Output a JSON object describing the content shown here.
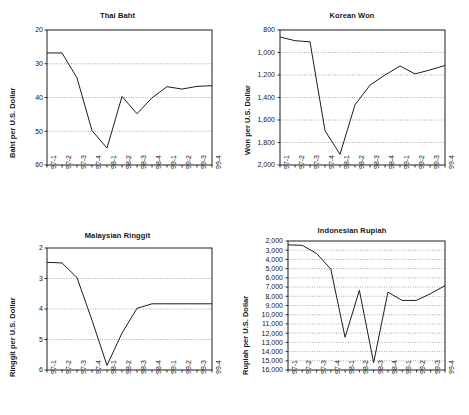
{
  "figure": {
    "width": 469,
    "height": 415,
    "background": "#ffffff",
    "line_color": "#1d1d1d",
    "grid_color": "#6e6e6e",
    "text_color": "#161616"
  },
  "categories": [
    "97-1",
    "97-2",
    "97-3",
    "97-4",
    "98-1",
    "98-2",
    "98-3",
    "98-4",
    "99-1",
    "99-2",
    "99-3",
    "99-4"
  ],
  "chart_data": [
    {
      "type": "line",
      "id": "thai-baht",
      "title": "Thai Baht",
      "xlabel": "",
      "ylabel": "Baht per U.S. Dollar",
      "x": [
        "97-1",
        "97-2",
        "97-3",
        "97-4",
        "98-1",
        "98-2",
        "98-3",
        "98-4",
        "99-1",
        "99-2",
        "99-3",
        "99-4"
      ],
      "values": [
        26.8,
        26.8,
        34.2,
        49.8,
        55.0,
        39.7,
        44.8,
        40.1,
        36.8,
        37.5,
        36.7,
        36.5
      ],
      "yticks": [
        "20",
        "30",
        "40",
        "50",
        "60"
      ],
      "ytickvalues": [
        20,
        30,
        40,
        50,
        60
      ],
      "ylim": [
        20,
        60
      ],
      "y_inverted": true,
      "grid": true,
      "legend": "none"
    },
    {
      "type": "line",
      "id": "korean-won",
      "title": "Korean Won",
      "xlabel": "",
      "ylabel": "Won per U.S. Dollar",
      "x": [
        "97-1",
        "97-2",
        "97-3",
        "97-4",
        "98-1",
        "98-2",
        "98-3",
        "98-4",
        "99-1",
        "99-2",
        "99-3",
        "99-4"
      ],
      "values": [
        862,
        895,
        905,
        1695,
        1905,
        1465,
        1290,
        1200,
        1120,
        1190,
        1155,
        1115
      ],
      "yticks": [
        "800",
        "1,000",
        "1,200",
        "1,400",
        "1,600",
        "1,800",
        "2,000"
      ],
      "ytickvalues": [
        800,
        1000,
        1200,
        1400,
        1600,
        1800,
        2000
      ],
      "ylim": [
        800,
        2000
      ],
      "y_inverted": true,
      "grid": true,
      "legend": "none"
    },
    {
      "type": "line",
      "id": "malaysian-ringgit",
      "title": "Malaysian Ringgit",
      "xlabel": "",
      "ylabel": "Ringgit per U.S. Dollar",
      "x": [
        "97-1",
        "97-2",
        "97-3",
        "97-4",
        "98-1",
        "98-2",
        "98-3",
        "98-4",
        "99-1",
        "99-2",
        "99-3",
        "99-4"
      ],
      "values": [
        2.47,
        2.49,
        2.97,
        4.37,
        5.85,
        4.79,
        3.98,
        3.83,
        3.83,
        3.83,
        3.83,
        3.83
      ],
      "yticks": [
        "2",
        "3",
        "4",
        "5",
        "6"
      ],
      "ytickvalues": [
        2,
        3,
        4,
        5,
        6
      ],
      "ylim": [
        2,
        6
      ],
      "y_inverted": true,
      "grid": true,
      "legend": "none"
    },
    {
      "type": "line",
      "id": "indonesian-rupiah",
      "title": "Indonesian Rupiah",
      "xlabel": "",
      "ylabel": "Rupiah per U.S. Dollar",
      "x": [
        "97-1",
        "97-2",
        "97-3",
        "97-4",
        "98-1",
        "98-2",
        "98-3",
        "98-4",
        "99-1",
        "99-2",
        "99-3",
        "99-4"
      ],
      "values": [
        2420,
        2470,
        3350,
        5050,
        12450,
        7350,
        15200,
        7550,
        8450,
        8450,
        7700,
        6850
      ],
      "yticks": [
        "2,000",
        "3,000",
        "4,000",
        "5,000",
        "6,000",
        "7,000",
        "8,000",
        "9,000",
        "10,000",
        "11,000",
        "12,000",
        "13,000",
        "14,000",
        "15,000",
        "16,000"
      ],
      "ytickvalues": [
        2000,
        3000,
        4000,
        5000,
        6000,
        7000,
        8000,
        9000,
        10000,
        11000,
        12000,
        13000,
        14000,
        15000,
        16000
      ],
      "ylim": [
        2000,
        16000
      ],
      "y_inverted": true,
      "grid": true,
      "legend": "none"
    }
  ]
}
